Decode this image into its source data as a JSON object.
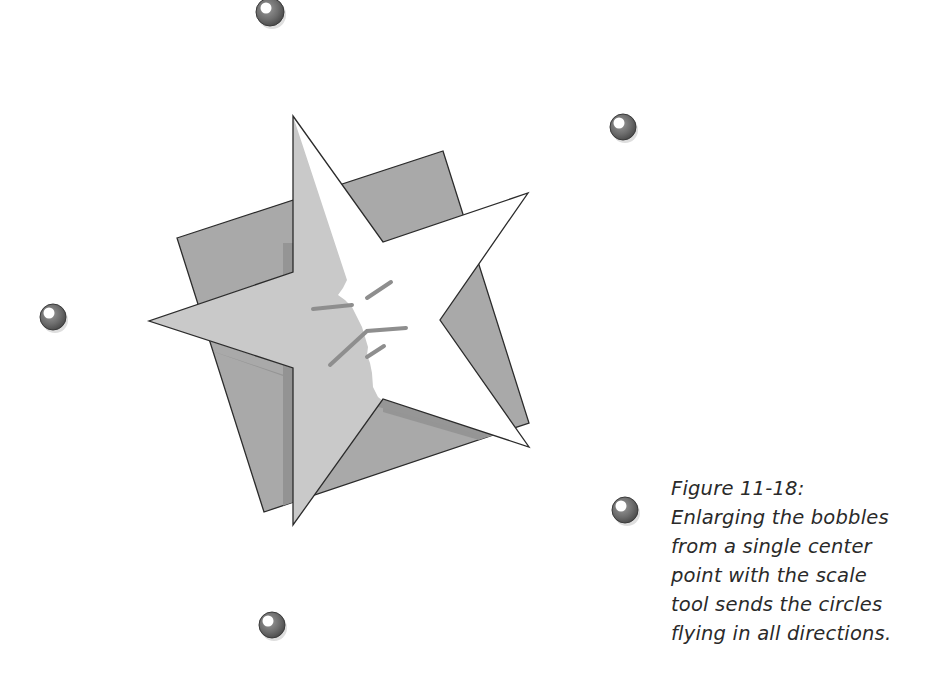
{
  "figure": {
    "label": "Figure 11-18:",
    "caption_lines": [
      "Enlarging the bobbles",
      "from a single center",
      "point with the scale",
      "tool sends the circles",
      "flying in all directions."
    ]
  },
  "illustration": {
    "subject": "star-with-face-over-tilted-square",
    "bobble_count": 6,
    "colors": {
      "background": "#ffffff",
      "square_fill": "#a9a9a9",
      "square_shadow": "#939393",
      "star_shaded": "#c9c9c9",
      "star_light": "#ffffff",
      "outline": "#2b2b2b",
      "face_lines": "#8e8e8e",
      "bobble": "#6f6f6f",
      "bobble_highlight": "#ffffff"
    }
  }
}
